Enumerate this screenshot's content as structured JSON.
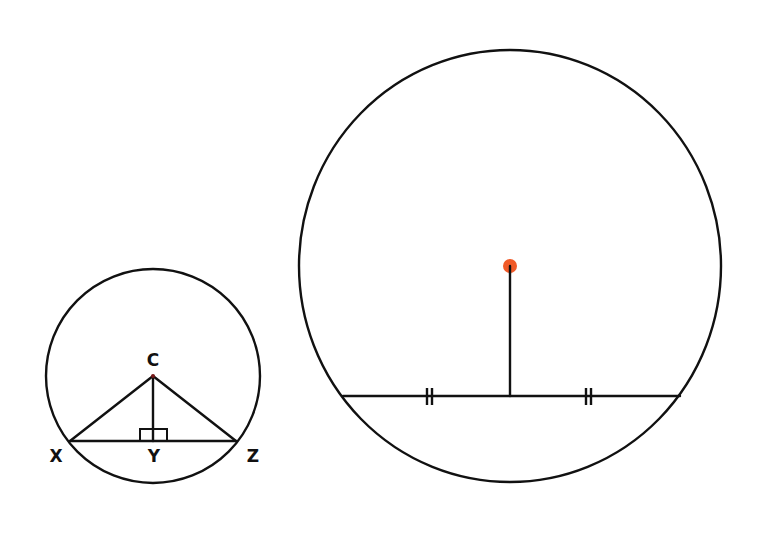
{
  "diagram": {
    "small_circle": {
      "center": [
        153,
        376
      ],
      "radius": 108,
      "labels": {
        "center": "C",
        "left_point": "X",
        "foot_point": "Y",
        "right_point": "Z"
      },
      "points": {
        "C": [
          153,
          376
        ],
        "X": [
          70,
          441
        ],
        "Y": [
          153,
          441
        ],
        "Z": [
          236,
          441
        ]
      },
      "right_angle_marker": true
    },
    "large_circle": {
      "center": [
        510,
        266
      ],
      "radius_x": 211,
      "radius_y": 216,
      "chord": {
        "left": [
          343,
          396
        ],
        "right": [
          680,
          396
        ]
      },
      "perpendicular_foot": [
        510,
        396
      ],
      "congruence_ticks": "double",
      "center_dot_color": "#f05a28"
    },
    "line_color": "#111111"
  }
}
